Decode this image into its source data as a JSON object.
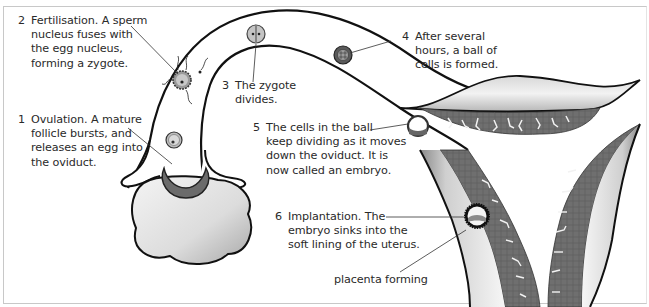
{
  "diagram": {
    "type": "biological-process",
    "colors": {
      "background": "#ffffff",
      "outline": "#111111",
      "tissue": "#6e6e6e",
      "ovary_fill": "#e6e6e6",
      "text": "#2a2a2a",
      "frame": "#c8c8c8"
    },
    "steps": [
      {
        "number": "1",
        "lines": [
          "Ovulation. A mature",
          "follicle bursts, and",
          "releases an egg into",
          "the oviduct."
        ]
      },
      {
        "number": "2",
        "lines": [
          "Fertilisation. A sperm",
          "nucleus fuses with",
          "the egg nucleus,",
          "forming a zygote."
        ]
      },
      {
        "number": "3",
        "lines": [
          "The zygote",
          "divides."
        ]
      },
      {
        "number": "4",
        "lines": [
          "After several",
          "hours, a ball of",
          "cells is formed."
        ]
      },
      {
        "number": "5",
        "lines": [
          "The cells in the ball",
          "keep dividing as it moves",
          "down the oviduct. It is",
          "now called an embryo."
        ]
      },
      {
        "number": "6",
        "lines": [
          "Implantation. The",
          "embryo sinks into the",
          "soft lining of the uterus."
        ]
      }
    ],
    "extra_labels": {
      "placenta": "placenta forming"
    },
    "structures": [
      "ovary",
      "follicle",
      "oviduct",
      "egg",
      "sperm",
      "zygote",
      "ball of cells",
      "embryo",
      "uterus",
      "uterine lining"
    ]
  }
}
